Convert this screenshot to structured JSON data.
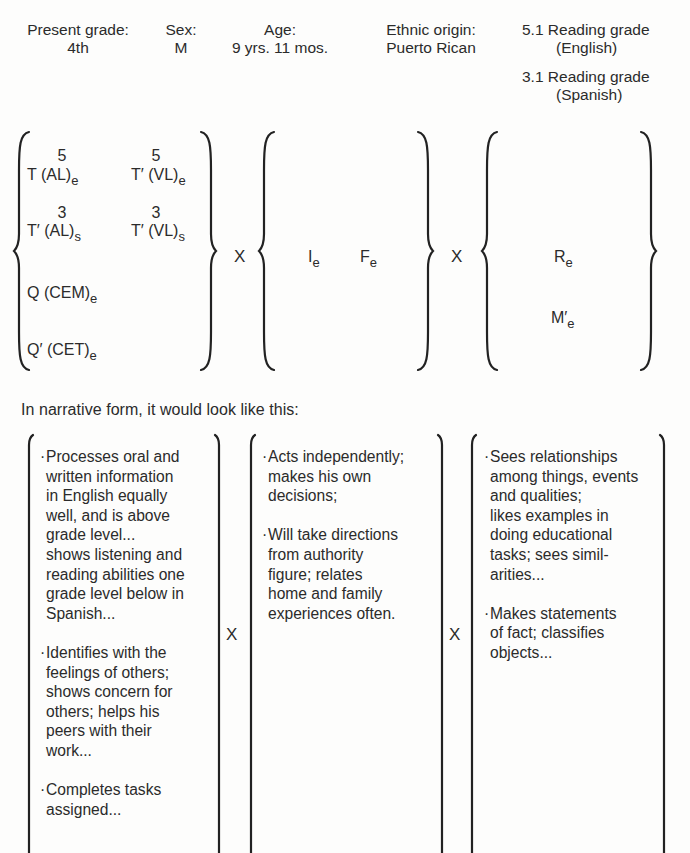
{
  "header": {
    "present_grade": {
      "label": "Present grade:",
      "value": "4th"
    },
    "sex": {
      "label": "Sex:",
      "value": "M"
    },
    "age": {
      "label": "Age:",
      "value": "9 yrs. 11 mos."
    },
    "ethnic_origin": {
      "label": "Ethnic origin:",
      "value": "Puerto Rican"
    },
    "reading_english": {
      "line1": "5.1 Reading grade",
      "line2": "(English)"
    },
    "reading_spanish": {
      "line1": "3.1 Reading grade",
      "line2": "(Spanish)"
    }
  },
  "formula": {
    "group1": {
      "row1": [
        {
          "sup": "5",
          "main": "T (AL)",
          "sub": "e"
        },
        {
          "sup": "5",
          "main": "T′ (VL)",
          "sub": "e"
        }
      ],
      "row2": [
        {
          "sup": "3",
          "main": "T′ (AL)",
          "sub": "s"
        },
        {
          "sup": "3",
          "main": "T′ (VL)",
          "sub": "s"
        }
      ],
      "row3": {
        "main": "Q (CEM)",
        "sub": "e"
      },
      "row4": {
        "main": "Q′ (CET)",
        "sub": "e"
      }
    },
    "operator": "X",
    "group2": [
      {
        "main": "I",
        "sub": "e"
      },
      {
        "main": "F",
        "sub": "e"
      }
    ],
    "group3": [
      {
        "main": "R",
        "sub": "e"
      },
      {
        "main": "M′",
        "sub": "e"
      }
    ]
  },
  "narrative_intro": "In narrative form, it would look like this:",
  "narrative": {
    "operator": "X",
    "box1": [
      "Processes oral and written information in English equally well, and is above grade level... shows listening and reading abilities one grade level below in Spanish...",
      "Identifies with the feelings of others; shows concern for others; helps his peers with their work...",
      "Completes tasks assigned..."
    ],
    "box2": [
      "Acts independently; makes his own decisions;",
      "Will take directions from authority figure; relates home and family experiences often."
    ],
    "box3": [
      "Sees relationships among things, events and qualities; likes examples in doing educational tasks; sees similarities...",
      "Makes statements of fact; classifies objects..."
    ],
    "box1_lines": [
      [
        "Processes oral and",
        "written information",
        "in English equally",
        "well, and is above",
        "grade level...",
        "shows listening and",
        "reading abilities one",
        "grade level below in",
        "Spanish..."
      ],
      [
        "Identifies with the",
        "feelings of others;",
        "shows concern for",
        "others; helps his",
        "peers with their",
        "work..."
      ],
      [
        "Completes tasks",
        "assigned..."
      ]
    ],
    "box2_lines": [
      [
        "Acts independently;",
        "makes his own",
        "decisions;"
      ],
      [
        "Will take directions",
        "from authority",
        "figure; relates",
        "home and family",
        "experiences often."
      ]
    ],
    "box3_lines": [
      [
        "Sees relationships",
        "among things, events",
        "and qualities;",
        "likes examples in",
        "doing educational",
        "tasks; sees simil-",
        "arities..."
      ],
      [
        "Makes statements",
        "of fact; classifies",
        "objects..."
      ]
    ],
    "bullet": "·"
  }
}
